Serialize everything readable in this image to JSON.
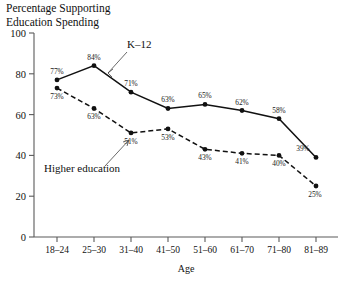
{
  "chart_data": {
    "type": "line",
    "title": "Percentage Supporting\nEducation Spending",
    "title_line1": "Percentage Supporting",
    "title_line2": "Education Spending",
    "xlabel": "Age",
    "ylabel": "",
    "ylim": [
      0,
      100
    ],
    "yticks": [
      0,
      20,
      40,
      60,
      80,
      100
    ],
    "grid": false,
    "legend": "inline-annotations",
    "categories": [
      "18–24",
      "25–30",
      "31–40",
      "41–50",
      "51–60",
      "61–70",
      "71–80",
      "81–89"
    ],
    "series": [
      {
        "name": "K–12",
        "style": "solid",
        "values": [
          77,
          84,
          71,
          63,
          65,
          62,
          58,
          39
        ],
        "labels": [
          "77%",
          "84%",
          "71%",
          "63%",
          "65%",
          "62%",
          "58%",
          "39%"
        ]
      },
      {
        "name": "Higher education",
        "style": "dashed",
        "values": [
          73,
          63,
          51,
          53,
          43,
          41,
          40,
          25
        ],
        "labels": [
          "73%",
          "63%",
          "51%",
          "53%",
          "43%",
          "41%",
          "40%",
          "25%"
        ]
      }
    ],
    "annotations": [
      {
        "text": "K–12",
        "target_series": "K–12"
      },
      {
        "text": "Higher education",
        "target_series": "Higher education"
      }
    ]
  },
  "ticklabels": {
    "y": [
      "0",
      "20",
      "40",
      "60",
      "80",
      "100"
    ],
    "x": [
      "18–24",
      "25–30",
      "31–40",
      "41–50",
      "51–60",
      "61–70",
      "71–80",
      "81–89"
    ]
  },
  "colors": {
    "ink": "#111111",
    "axis": "#5a5a5a",
    "background": "#ffffff"
  }
}
